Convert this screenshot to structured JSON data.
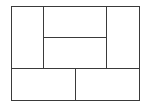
{
  "diagram": {
    "type": "rectangle-partition",
    "stroke_color": "#3a3a3a",
    "background": "#ffffff",
    "outer": {
      "x": 11,
      "y": 6,
      "w": 128,
      "h": 94
    },
    "regions": [
      {
        "name": "left-tall",
        "x": 11,
        "y": 6,
        "w": 32,
        "h": 62
      },
      {
        "name": "center-top",
        "x": 43,
        "y": 6,
        "w": 63,
        "h": 31
      },
      {
        "name": "center-bottom",
        "x": 43,
        "y": 37,
        "w": 63,
        "h": 31
      },
      {
        "name": "right-tall",
        "x": 106,
        "y": 6,
        "w": 33,
        "h": 62
      },
      {
        "name": "bottom-left",
        "x": 11,
        "y": 68,
        "w": 64,
        "h": 32
      },
      {
        "name": "bottom-right",
        "x": 75,
        "y": 68,
        "w": 64,
        "h": 32
      }
    ]
  }
}
